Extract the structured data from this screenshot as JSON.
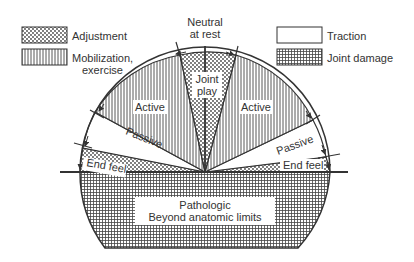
{
  "legend": {
    "adjustment": "Adjustment",
    "mobilization_line1": "Mobilization,",
    "mobilization_line2": "exercise",
    "traction": "Traction",
    "joint_damage": "Joint damage"
  },
  "diagram": {
    "neutral_line1": "Neutral",
    "neutral_line2": "at rest",
    "joint_play_line1": "Joint",
    "joint_play_line2": "play",
    "active_left": "Active",
    "active_right": "Active",
    "passive_left": "Passive",
    "passive_right": "Passive",
    "end_feel_left": "End feel",
    "end_feel_right": "End feel",
    "pathologic_line1": "Pathologic",
    "pathologic_line2": "Beyond anatomic limits"
  },
  "colors": {
    "ink": "#333333",
    "background": "#ffffff"
  }
}
